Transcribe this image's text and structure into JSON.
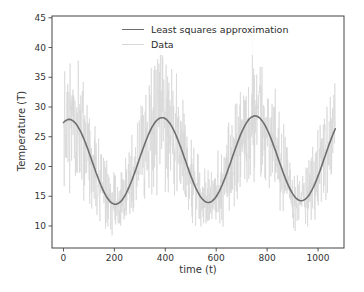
{
  "figure": {
    "background": "#ffffff",
    "text_color": "#333333",
    "spine_color": "#444444"
  },
  "legend": {
    "position": "upper center",
    "items": [
      {
        "label": "Least squares approximation",
        "color": "#6e6e6e",
        "line_width": 1.6
      },
      {
        "label": "Data",
        "color": "#d7d7d7",
        "line_width": 1.4
      }
    ]
  },
  "chart_data": {
    "type": "line",
    "title": "",
    "xlabel": "time (t)",
    "ylabel": "Temperature (T)",
    "xlim": [
      -45,
      1102
    ],
    "ylim": [
      6.3,
      45.3
    ],
    "xticks": [
      0,
      200,
      400,
      600,
      800,
      1000
    ],
    "yticks": [
      10,
      15,
      20,
      25,
      30,
      35,
      40,
      45
    ],
    "grid": false,
    "legend_position": "upper center",
    "series": [
      {
        "name": "Least squares approximation",
        "kind": "fit-curve",
        "color": "#6e6e6e",
        "line_width": 1.6,
        "model": {
          "form": "mean + trend*t + amplitude*cos(2*pi*(t-peak_t)/period)",
          "mean": 20.7,
          "trend": 0.0008,
          "amplitude": 7.2,
          "period": 365,
          "peak_t": 22,
          "t_start": 0,
          "t_end": 1068
        },
        "sample_points": [
          [
            0,
            27.4
          ],
          [
            100,
            22.4
          ],
          [
            200,
            13.7
          ],
          [
            300,
            21.5
          ],
          [
            400,
            28.0
          ],
          [
            500,
            18.5
          ],
          [
            600,
            14.9
          ],
          [
            700,
            25.8
          ],
          [
            800,
            26.2
          ],
          [
            900,
            15.4
          ],
          [
            1000,
            18.4
          ],
          [
            1068,
            26.1
          ]
        ],
        "peaks_t": [
          22,
          387,
          752
        ],
        "peak_values": [
          27.8,
          28.1,
          28.5
        ],
        "troughs_t": [
          204,
          570,
          934
        ],
        "trough_values": [
          13.5,
          13.8,
          14.1
        ]
      },
      {
        "name": "Data",
        "kind": "noisy-observations",
        "color": "#d7d7d7",
        "line_width": 0.7,
        "noise": {
          "relative_spread": 0.4,
          "distribution": "triangular",
          "step": 1,
          "seed": 1234567
        },
        "approx_value_range": [
          9,
          43.5
        ]
      }
    ]
  }
}
